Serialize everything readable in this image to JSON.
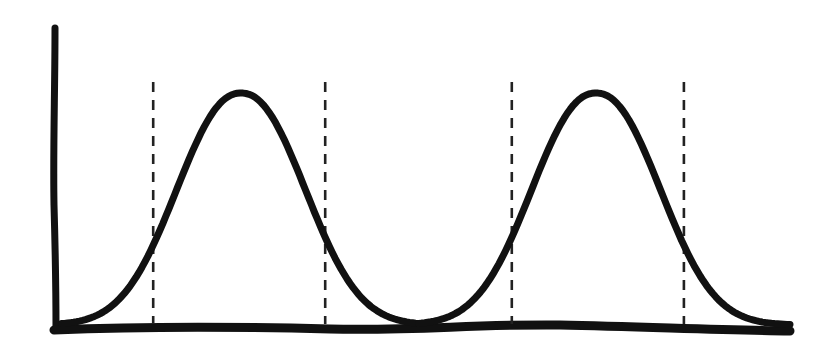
{
  "chart_data": {
    "type": "line",
    "title": "",
    "xlabel": "",
    "ylabel": "",
    "style": "hand-drawn sketch",
    "colors": {
      "ink": "#111111",
      "background": "#ffffff"
    },
    "xlim": [
      0,
      10
    ],
    "ylim": [
      0,
      1
    ],
    "grid": false,
    "legend": "none",
    "series": [
      {
        "name": "bell-curve-1",
        "shape": "gaussian",
        "mean": 2.5,
        "sd": 0.85,
        "peak": 1.0
      },
      {
        "name": "bell-curve-2",
        "shape": "gaussian",
        "mean": 7.35,
        "sd": 0.85,
        "peak": 1.0
      }
    ],
    "boundaries": [
      {
        "name": "curve-1-left-bound",
        "x": 1.3
      },
      {
        "name": "curve-1-right-bound",
        "x": 3.65
      },
      {
        "name": "curve-2-left-bound",
        "x": 6.2
      },
      {
        "name": "curve-2-right-bound",
        "x": 8.55
      }
    ]
  }
}
